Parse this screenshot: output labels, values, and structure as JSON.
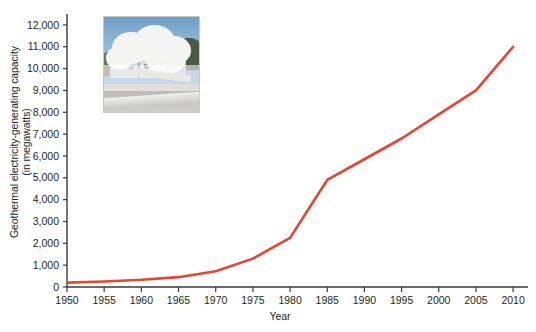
{
  "chart_data": {
    "type": "line",
    "title": "",
    "xlabel": "Year",
    "ylabel_line1": "Geothermal electricity-generating capacity",
    "ylabel_line2": "(in megawatts)",
    "xlim": [
      1950,
      2012
    ],
    "ylim": [
      0,
      12500
    ],
    "xticks": [
      1950,
      1955,
      1960,
      1965,
      1970,
      1975,
      1980,
      1985,
      1990,
      1995,
      2000,
      2005,
      2010
    ],
    "xticklabels": [
      "1950",
      "1955",
      "1960",
      "1965",
      "1970",
      "1975",
      "1980",
      "1985",
      "1990",
      "1995",
      "2000",
      "2005",
      "2010"
    ],
    "yticks": [
      0,
      1000,
      2000,
      3000,
      4000,
      5000,
      6000,
      7000,
      8000,
      9000,
      10000,
      11000,
      12000
    ],
    "yticklabels": [
      "0",
      "1,000",
      "2,000",
      "3,000",
      "4,000",
      "5,000",
      "6,000",
      "7,000",
      "8,000",
      "9,000",
      "10,000",
      "11,000",
      "12,000"
    ],
    "grid": false,
    "legend": "none",
    "line_color": "#e8442f",
    "line_width": 2.6,
    "series": [
      {
        "name": "Geothermal electricity-generating capacity",
        "x": [
          1950,
          1955,
          1960,
          1965,
          1970,
          1975,
          1980,
          1985,
          1990,
          1995,
          2000,
          2005,
          2010
        ],
        "values": [
          200,
          250,
          330,
          450,
          720,
          1300,
          2250,
          4900,
          5850,
          6800,
          7900,
          9000,
          11000
        ]
      }
    ]
  },
  "figure": {
    "axis_color": "#3a3a3a",
    "text_color": "#231f20",
    "background": "#ffffff"
  },
  "photo": {
    "caption": "geothermal-power-plant-steam-photo",
    "alt": "Geothermal power plant emitting large plumes of white steam"
  }
}
